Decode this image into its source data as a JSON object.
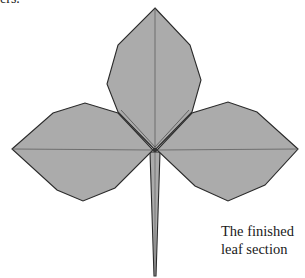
{
  "page": {
    "partial_top_text": "ers.",
    "caption": {
      "line1": "The finished",
      "line2": "leaf section"
    }
  },
  "diagram": {
    "fill_color": "#ababab",
    "stroke_color": "#2a2a2a",
    "crease_color": "#555555",
    "parts": [
      "top-leaflet",
      "left-leaflet",
      "right-leaflet",
      "stem"
    ]
  }
}
